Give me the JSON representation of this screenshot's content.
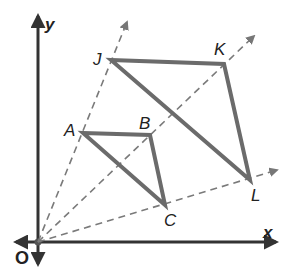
{
  "diagram": {
    "type": "dilation",
    "colors": {
      "axis": "#333333",
      "triangle": "#6b6b6b",
      "ray": "#7a7a7a",
      "label": "#222222"
    },
    "axes": {
      "x_label": "x",
      "y_label": "y",
      "origin_label": "O"
    },
    "small_triangle": {
      "vertices": [
        {
          "label": "A"
        },
        {
          "label": "B"
        },
        {
          "label": "C"
        }
      ]
    },
    "large_triangle": {
      "vertices": [
        {
          "label": "J"
        },
        {
          "label": "K"
        },
        {
          "label": "L"
        }
      ]
    },
    "rays": [
      {
        "from": "O",
        "through": [
          "A",
          "J"
        ]
      },
      {
        "from": "O",
        "through": [
          "B",
          "K"
        ]
      },
      {
        "from": "O",
        "through": [
          "C",
          "L"
        ]
      }
    ]
  }
}
